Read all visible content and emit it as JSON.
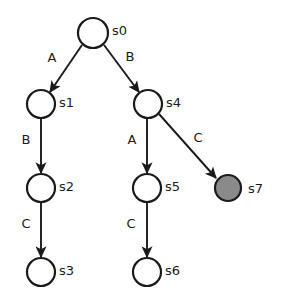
{
  "diagram": {
    "type": "state-transition-tree",
    "background_color": "#ffffff",
    "stroke_color": "#1a1a1a",
    "node_fill_default": "#ffffff",
    "node_fill_highlight": "#8a8a8a",
    "nodes": [
      {
        "id": "s0",
        "label": "s0",
        "cx": 93,
        "cy": 33,
        "r": 15,
        "filled": false,
        "label_x": 112,
        "label_y": 31
      },
      {
        "id": "s1",
        "label": "s1",
        "cx": 41,
        "cy": 104,
        "r": 14,
        "filled": false,
        "label_x": 59,
        "label_y": 103
      },
      {
        "id": "s4",
        "label": "s4",
        "cx": 148,
        "cy": 104,
        "r": 14,
        "filled": false,
        "label_x": 166,
        "label_y": 103
      },
      {
        "id": "s2",
        "label": "s2",
        "cx": 41,
        "cy": 188,
        "r": 14,
        "filled": false,
        "label_x": 59,
        "label_y": 187
      },
      {
        "id": "s5",
        "label": "s5",
        "cx": 147,
        "cy": 188,
        "r": 14,
        "filled": false,
        "label_x": 165,
        "label_y": 187
      },
      {
        "id": "s7",
        "label": "s7",
        "cx": 228,
        "cy": 188,
        "r": 13,
        "filled": true,
        "label_x": 248,
        "label_y": 189
      },
      {
        "id": "s3",
        "label": "s3",
        "cx": 41,
        "cy": 272,
        "r": 14,
        "filled": false,
        "label_x": 59,
        "label_y": 271
      },
      {
        "id": "s6",
        "label": "s6",
        "cx": 147,
        "cy": 272,
        "r": 14,
        "filled": false,
        "label_x": 165,
        "label_y": 271
      }
    ],
    "edges": [
      {
        "id": "s0-s1",
        "from": "s0",
        "to": "s1",
        "label": "A",
        "x1": 82,
        "y1": 45,
        "x2": 50,
        "y2": 92,
        "label_x": 52,
        "label_y": 58
      },
      {
        "id": "s0-s4",
        "from": "s0",
        "to": "s4",
        "label": "B",
        "x1": 104,
        "y1": 45,
        "x2": 139,
        "y2": 92,
        "label_x": 130,
        "label_y": 57
      },
      {
        "id": "s1-s2",
        "from": "s1",
        "to": "s2",
        "label": "B",
        "x1": 41,
        "y1": 118,
        "x2": 41,
        "y2": 173,
        "label_x": 26,
        "label_y": 140
      },
      {
        "id": "s2-s3",
        "from": "s2",
        "to": "s3",
        "label": "C",
        "x1": 41,
        "y1": 202,
        "x2": 41,
        "y2": 257,
        "label_x": 26,
        "label_y": 224
      },
      {
        "id": "s4-s5",
        "from": "s4",
        "to": "s5",
        "label": "A",
        "x1": 147,
        "y1": 118,
        "x2": 147,
        "y2": 173,
        "label_x": 132,
        "label_y": 140
      },
      {
        "id": "s4-s7",
        "from": "s4",
        "to": "s7",
        "label": "C",
        "x1": 159,
        "y1": 114,
        "x2": 216,
        "y2": 178,
        "label_x": 198,
        "label_y": 138
      },
      {
        "id": "s5-s6",
        "from": "s5",
        "to": "s6",
        "label": "C",
        "x1": 147,
        "y1": 202,
        "x2": 147,
        "y2": 257,
        "label_x": 131,
        "label_y": 224
      }
    ]
  }
}
